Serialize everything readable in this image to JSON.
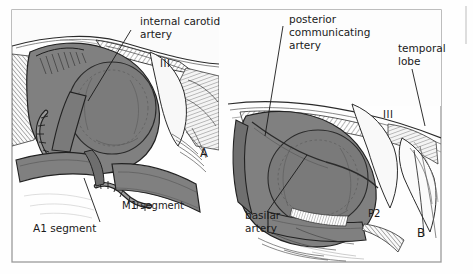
{
  "figure": {
    "title_visible": false,
    "panels": [
      {
        "id": "A",
        "letter": "A",
        "side": "left",
        "description": "Anterior view of internal carotid artery bifurcation with A1 and M1 segments and cranial nerve III"
      },
      {
        "id": "B",
        "letter": "B",
        "side": "right",
        "description": "Posterior view showing posterior communicating artery, basilar artery, P2 segment, temporal lobe and cranial nerve III"
      }
    ],
    "labels": {
      "internal_carotid_artery": "internal carotid\nartery",
      "internal_carotid_artery_line1": "internal carotid",
      "internal_carotid_artery_line2": "artery",
      "posterior_communicating_artery_line1": "posterior",
      "posterior_communicating_artery_line2": "communicating",
      "posterior_communicating_artery_line3": "artery",
      "temporal_lobe_line1": "temporal",
      "temporal_lobe_line2": "lobe",
      "basilar_artery_line1": "basilar",
      "basilar_artery_line2": "artery",
      "a1_segment": "A1 segment",
      "m1_segment": "M1 segment",
      "p2_segment": "P2",
      "cranial_nerve_left": "III",
      "cranial_nerve_right": "III",
      "panel_a": "A",
      "panel_b": "B"
    },
    "colors": {
      "background": "#fefefe",
      "frame_border": "#9a9a9a",
      "vessel_fill": "#808080",
      "vessel_fill_dark": "#6e6e6e",
      "vessel_fill_darker": "#5e5e5e",
      "brain_light": "#f2f2f2",
      "brain_mid": "#d8d8d8",
      "ink": "#1a1a1a",
      "hatch": "#4a4a4a",
      "label_text": "#1a1a1a"
    }
  }
}
